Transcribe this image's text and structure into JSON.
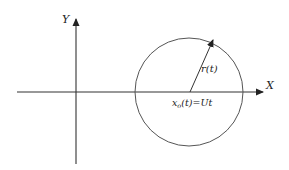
{
  "diagram": {
    "title": "",
    "axes": {
      "x_label": "X",
      "y_label": "Y"
    },
    "circle": {
      "radius_label": "r(t)",
      "center_label_main": "x",
      "center_label_sub": "o",
      "center_label_rest": "(t)=Ut"
    },
    "colors": {
      "stroke": "#333333",
      "circle_stroke": "#555555",
      "background": "#ffffff"
    }
  }
}
